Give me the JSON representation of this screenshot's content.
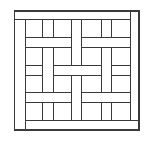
{
  "diagram": {
    "title": "Basket-weave parquet pattern",
    "stroke_color": "#3a3a3a",
    "background": "#ffffff",
    "frame": {
      "x": 14.7,
      "y": 11,
      "w": 124.3,
      "h": 119
    },
    "border_bars": [
      {
        "name": "top-bar",
        "x1": 14.7,
        "y1": 19.3,
        "x2": 130.7,
        "y2": 19.3
      },
      {
        "name": "right-bar",
        "x1": 130.7,
        "y1": 11,
        "x2": 130.7,
        "y2": 120.7
      },
      {
        "name": "left-bar",
        "x1": 25.7,
        "y1": 19.3,
        "x2": 25.7,
        "y2": 130
      },
      {
        "name": "bottom-bar",
        "x1": 25.7,
        "y1": 120.7,
        "x2": 139,
        "y2": 120.7
      }
    ],
    "vertical_lines": [
      {
        "x": 42.7,
        "segments": [
          [
            19.3,
            37.3
          ],
          [
            47.3,
            92.7
          ],
          [
            102.7,
            120.7
          ]
        ]
      },
      {
        "x": 53.3,
        "segments": [
          [
            19.3,
            37.3
          ],
          [
            47.3,
            92.7
          ],
          [
            102.7,
            120.7
          ]
        ]
      },
      {
        "x": 71.7,
        "segments": [
          [
            19.3,
            65
          ],
          [
            75,
            120.7
          ]
        ]
      },
      {
        "x": 81.7,
        "segments": [
          [
            19.3,
            65
          ],
          [
            75,
            120.7
          ]
        ]
      },
      {
        "x": 101,
        "segments": [
          [
            19.3,
            37.3
          ],
          [
            47.3,
            92.7
          ],
          [
            102.7,
            120.7
          ]
        ]
      },
      {
        "x": 111.7,
        "segments": [
          [
            19.3,
            37.3
          ],
          [
            47.3,
            92.7
          ],
          [
            102.7,
            120.7
          ]
        ]
      }
    ],
    "horizontal_lines": [
      {
        "y": 37.3,
        "segments": [
          [
            25.7,
            71.7
          ],
          [
            81.7,
            130.7
          ]
        ]
      },
      {
        "y": 47.3,
        "segments": [
          [
            25.7,
            71.7
          ],
          [
            81.7,
            130.7
          ]
        ]
      },
      {
        "y": 65,
        "segments": [
          [
            25.7,
            42.7
          ],
          [
            53.3,
            101
          ],
          [
            111.7,
            130.7
          ]
        ]
      },
      {
        "y": 75,
        "segments": [
          [
            25.7,
            42.7
          ],
          [
            53.3,
            101
          ],
          [
            111.7,
            130.7
          ]
        ]
      },
      {
        "y": 92.7,
        "segments": [
          [
            25.7,
            71.7
          ],
          [
            81.7,
            130.7
          ]
        ]
      },
      {
        "y": 102.7,
        "segments": [
          [
            25.7,
            71.7
          ],
          [
            81.7,
            130.7
          ]
        ]
      }
    ]
  }
}
